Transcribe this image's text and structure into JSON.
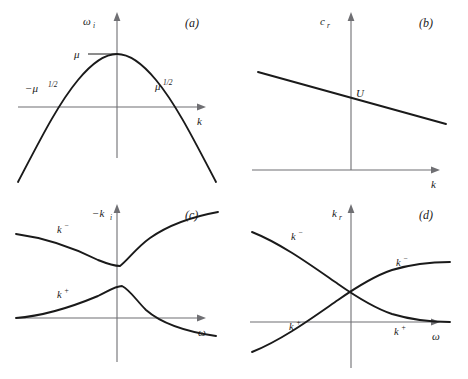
{
  "figure": {
    "panels": [
      {
        "id": "a",
        "letter": "(a)",
        "x_axis_label": "k",
        "y_axis_label": "ω",
        "y_axis_sub": "i",
        "annotations": [
          {
            "name": "peak-value",
            "text": "μ"
          },
          {
            "name": "left-root",
            "text": "−μ",
            "sup": "1/2"
          },
          {
            "name": "right-root",
            "text": "μ",
            "sup": "1/2"
          }
        ]
      },
      {
        "id": "b",
        "letter": "(b)",
        "x_axis_label": "k",
        "y_axis_label": "c",
        "y_axis_sub": "r",
        "annotations": [
          {
            "name": "intercept-point",
            "text": "U"
          }
        ]
      },
      {
        "id": "c",
        "letter": "(c)",
        "x_axis_label": "ω",
        "y_axis_label": "−k",
        "y_axis_sub": "i",
        "curve_labels": [
          {
            "name": "k-minus-branch",
            "text": "k",
            "sup": "−"
          },
          {
            "name": "k-plus-branch",
            "text": "k",
            "sup": "+"
          }
        ]
      },
      {
        "id": "d",
        "letter": "(d)",
        "x_axis_label": "ω",
        "y_axis_label": "k",
        "y_axis_sub": "r",
        "curve_labels": [
          {
            "name": "k-minus-left",
            "text": "k",
            "sup": "−"
          },
          {
            "name": "k-minus-right",
            "text": "k",
            "sup": "−"
          },
          {
            "name": "k-plus-left",
            "text": "k",
            "sup": "+"
          },
          {
            "name": "k-plus-right",
            "text": "k",
            "sup": "+"
          }
        ]
      }
    ]
  },
  "chart_data": [
    {
      "type": "line",
      "panel": "a",
      "title": "(a)",
      "xlabel": "k",
      "ylabel": "omega_i",
      "grid": false,
      "legend": "none",
      "description": "Inverted parabola omega_i = mu - k^2; peak value mu at k=0; zero crossings at k = -mu^(1/2) and k = +mu^(1/2).",
      "series": [
        {
          "name": "omega_i(k)",
          "path": "M 18,182 C 40,140 58,104 78,80 C 92,63 104,54 117,54 C 130,54 142,63 156,80 C 176,104 194,140 216,182"
        }
      ],
      "annotations": [
        {
          "text": "mu",
          "x": 0,
          "y": "mu"
        },
        {
          "text": "-mu^1/2",
          "x": "-mu^1/2",
          "y": 0
        },
        {
          "text": "mu^1/2",
          "x": "mu^1/2",
          "y": 0
        }
      ]
    },
    {
      "type": "line",
      "panel": "b",
      "title": "(b)",
      "xlabel": "k",
      "ylabel": "c_r",
      "grid": false,
      "legend": "none",
      "description": "Straight line with small negative slope, intersecting the vertical axis at the point labelled U.",
      "series": [
        {
          "name": "c_r(k)",
          "path": "M 24,72 L 212,124"
        }
      ],
      "annotations": [
        {
          "text": "U",
          "x": 0,
          "y": "U"
        }
      ]
    },
    {
      "type": "line",
      "panel": "c",
      "title": "(c)",
      "xlabel": "omega",
      "ylabel": "-k_i",
      "grid": false,
      "legend": "none",
      "description": "Two branches. k-minus decreases from upper left to a cusp minimum just right of the origin then rises steadily. k-plus rises from the left near the axis to a rounded peak at the same omega then decays, crossing below the omega axis on the right.",
      "series": [
        {
          "name": "k-",
          "path": "M 16,44 C 46,48 74,58 98,70 C 108,74 114,76 120,76 C 128,70 136,58 150,48 C 170,34 196,26 218,22"
        },
        {
          "name": "k+",
          "path": "M 16,128 C 44,126 74,116 98,106 C 110,100 116,96 122,96 C 130,100 136,110 146,120 C 162,134 188,142 216,146"
        }
      ]
    },
    {
      "type": "line",
      "panel": "d",
      "title": "(d)",
      "xlabel": "omega",
      "ylabel": "k_r",
      "grid": false,
      "legend": "none",
      "description": "Two crossing branches forming an X above the omega axis to the right of the vertical axis. k-minus descends from the upper left; k-plus ascends from the lower left; after crossing, the upper right branch is k-minus and the lower right branch is k-plus.",
      "series": [
        {
          "name": "k- (upper-left to lower-right)",
          "path": "M 18,42 C 48,54 78,76 104,94 C 124,108 140,118 158,124 C 178,130 198,132 216,132"
        },
        {
          "name": "k+ (lower-left to upper-right)",
          "path": "M 18,162 C 48,150 78,128 104,110 C 124,96 140,86 158,80 C 178,74 198,72 216,72"
        }
      ]
    }
  ]
}
